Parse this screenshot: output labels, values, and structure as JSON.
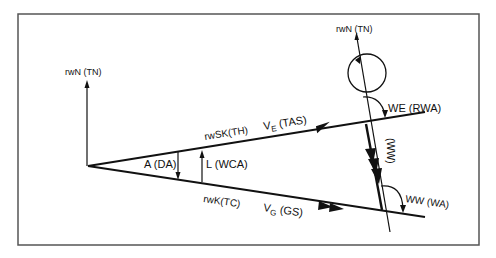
{
  "diagram": {
    "type": "wind-triangle",
    "labels": {
      "north_left": "rwN (TN)",
      "north_right": "rwN (TN)",
      "heading": "rwSK(TH)",
      "course": "rwK(TC)",
      "drift_angle": "A (DA)",
      "wind_correction_angle": "L (WCA)",
      "tas_v": "V",
      "tas_sub": "E",
      "tas_text": "(TAS)",
      "gs_v": "V",
      "gs_sub": "G",
      "gs_text": "(GS)",
      "rwa": "WE (RWA)",
      "wa": "WW (WA)",
      "wind_vector": "(WW)"
    },
    "colors": {
      "line": "#111111",
      "frame": "#555555",
      "background": "#ffffff"
    }
  }
}
